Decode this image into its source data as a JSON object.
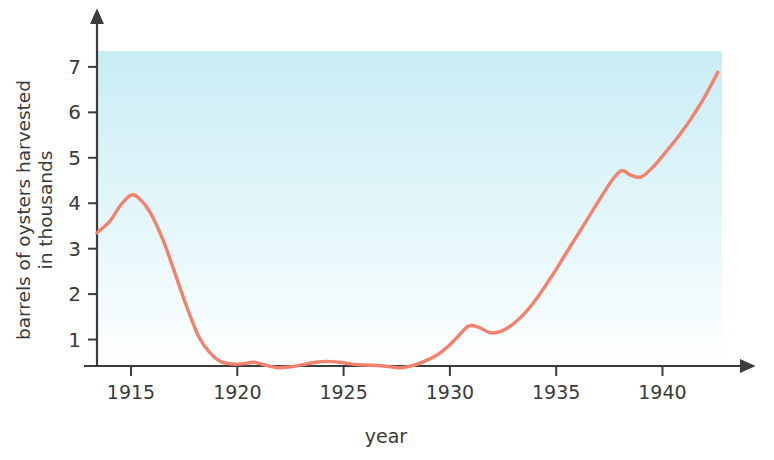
{
  "chart_data": {
    "type": "line",
    "title": "",
    "xlabel": "year",
    "ylabel": "barrels of oysters harvested in thousands",
    "ylabel_line1": "barrels of oysters harvested",
    "ylabel_line2": "in thousands",
    "xlim": [
      1913.4,
      1942.8
    ],
    "ylim": [
      0,
      7.35
    ],
    "xticks": [
      1915,
      1920,
      1925,
      1930,
      1935,
      1940
    ],
    "xtick_labels": [
      "1915",
      "1920",
      "1925",
      "1930",
      "1935",
      "1940"
    ],
    "yticks": [
      1,
      2,
      3,
      4,
      5,
      6,
      7
    ],
    "ytick_labels": [
      "1",
      "2",
      "3",
      "4",
      "5",
      "6",
      "7"
    ],
    "grid": false,
    "legend": "none",
    "series": [
      {
        "name": "barrels of oysters harvested",
        "color": "#f2816e",
        "x": [
          1913.4,
          1914.0,
          1914.5,
          1915.0,
          1915.4,
          1915.9,
          1916.5,
          1917.0,
          1917.6,
          1918.2,
          1918.7,
          1919.2,
          1919.8,
          1920.3,
          1920.8,
          1921.3,
          1921.9,
          1922.5,
          1923.1,
          1923.7,
          1924.2,
          1924.8,
          1925.4,
          1926.0,
          1926.6,
          1927.2,
          1927.7,
          1928.2,
          1928.8,
          1929.4,
          1929.9,
          1930.4,
          1930.9,
          1931.4,
          1931.9,
          1932.4,
          1933.0,
          1933.6,
          1934.2,
          1934.8,
          1935.4,
          1936.0,
          1936.6,
          1937.2,
          1937.7,
          1938.1,
          1938.5,
          1939.0,
          1939.6,
          1940.2,
          1940.8,
          1941.4,
          1942.0,
          1942.6
        ],
        "y": [
          3.35,
          3.6,
          3.95,
          4.18,
          4.1,
          3.8,
          3.2,
          2.55,
          1.75,
          1.05,
          0.72,
          0.52,
          0.46,
          0.47,
          0.5,
          0.44,
          0.38,
          0.4,
          0.45,
          0.5,
          0.52,
          0.5,
          0.46,
          0.44,
          0.43,
          0.4,
          0.38,
          0.42,
          0.52,
          0.66,
          0.84,
          1.08,
          1.3,
          1.26,
          1.15,
          1.18,
          1.35,
          1.62,
          1.98,
          2.4,
          2.85,
          3.3,
          3.75,
          4.2,
          4.55,
          4.72,
          4.62,
          4.58,
          4.82,
          5.15,
          5.5,
          5.9,
          6.35,
          6.88
        ]
      }
    ],
    "colors": {
      "line": "#f2816e",
      "plot_bg_top": "#c9edf5",
      "plot_bg_bottom": "#ffffff",
      "axis": "#3c3c3c",
      "text": "#3a3a3a",
      "page_bg": "#ffffff"
    },
    "plot_area": {
      "left": 97,
      "right": 722,
      "top": 51,
      "bottom": 366
    }
  }
}
